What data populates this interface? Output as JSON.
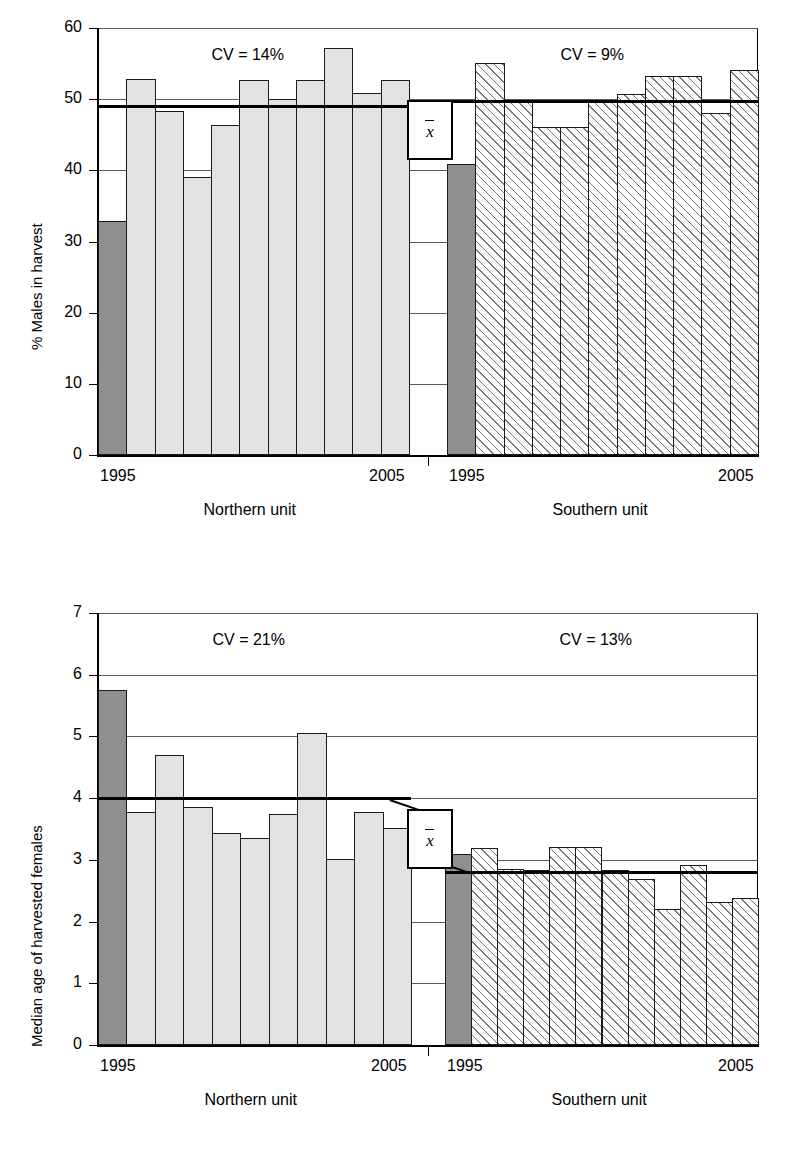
{
  "figure": {
    "panels": [
      {
        "id": "top",
        "ylabel": "% Males in harvest",
        "ylim": [
          0,
          60
        ],
        "yticks": [
          "0",
          "10",
          "20",
          "30",
          "40",
          "50",
          "60"
        ],
        "ytick_values": [
          0,
          10,
          20,
          30,
          40,
          50,
          60
        ],
        "groups": [
          {
            "name": "Northern unit",
            "unit_label": "Northern unit",
            "cv_label": "CV = 14%",
            "x_start_label": "1995",
            "x_end_label": "2005",
            "mean": 49.0,
            "values": [
              32.9,
              52.8,
              48.3,
              39.1,
              46.4,
              52.7,
              50.0,
              52.7,
              57.2,
              50.9,
              52.7
            ]
          },
          {
            "name": "Southern unit",
            "unit_label": "Southern unit",
            "cv_label": "CV = 9%",
            "x_start_label": "1995",
            "x_end_label": "2005",
            "mean": 49.8,
            "values": [
              40.9,
              55.1,
              49.8,
              46.1,
              46.1,
              49.8,
              50.7,
              53.2,
              53.2,
              48.0,
              54.1
            ]
          }
        ]
      },
      {
        "id": "bottom",
        "ylabel": "Median age of harvested females",
        "ylim": [
          0,
          7
        ],
        "yticks": [
          "0",
          "1",
          "2",
          "3",
          "4",
          "5",
          "6",
          "7"
        ],
        "ytick_values": [
          0,
          1,
          2,
          3,
          4,
          5,
          6,
          7
        ],
        "groups": [
          {
            "name": "Northern unit",
            "unit_label": "Northern unit",
            "cv_label": "CV = 21%",
            "x_start_label": "1995",
            "x_end_label": "2005",
            "mean": 4.0,
            "values": [
              5.75,
              3.78,
              4.7,
              3.85,
              3.44,
              3.35,
              3.74,
              5.05,
              3.02,
              3.78,
              3.52
            ]
          },
          {
            "name": "Southern unit",
            "unit_label": "Southern unit",
            "cv_label": "CV = 13%",
            "x_start_label": "1995",
            "x_end_label": "2005",
            "mean": 2.8,
            "values": [
              3.1,
              3.19,
              2.86,
              2.83,
              3.21,
              3.21,
              2.83,
              2.69,
              2.2,
              2.91,
              2.31,
              2.39
            ]
          }
        ]
      }
    ],
    "mean_marker": "x̄",
    "colors": {
      "first_bar": "#8f8f8f",
      "bar_fill": "#e2e2e2",
      "outline": "#1a1a1a",
      "gridline": "#5a5a5a"
    }
  },
  "chart_data": [
    {
      "type": "bar",
      "title": "",
      "xlabel": "",
      "ylabel": "% Males in harvest",
      "ylim": [
        0,
        60
      ],
      "yticks": [
        0,
        10,
        20,
        30,
        40,
        50,
        60
      ],
      "grid": true,
      "legend": "none",
      "panels": [
        {
          "name": "Northern unit",
          "annotation": "CV = 14%",
          "mean_line": 49.0,
          "mean_line_label": "x̄",
          "categories": [
            "1995",
            "1996",
            "1997",
            "1998",
            "1999",
            "2000",
            "2001",
            "2002",
            "2003",
            "2004",
            "2005"
          ],
          "tick_labels_shown": [
            "1995",
            "2005"
          ],
          "values": [
            32.9,
            52.8,
            48.3,
            39.1,
            46.4,
            52.7,
            50.0,
            52.7,
            57.2,
            50.9,
            52.7
          ],
          "highlighted_first_bar": true
        },
        {
          "name": "Southern unit",
          "annotation": "CV = 9%",
          "mean_line": 49.8,
          "mean_line_label": "x̄",
          "categories": [
            "1995",
            "1996",
            "1997",
            "1998",
            "1999",
            "2000",
            "2001",
            "2002",
            "2003",
            "2004",
            "2005"
          ],
          "tick_labels_shown": [
            "1995",
            "2005"
          ],
          "values": [
            40.9,
            55.1,
            49.8,
            46.1,
            46.1,
            49.8,
            50.7,
            53.2,
            53.2,
            48.0,
            54.1
          ],
          "highlighted_first_bar": true
        }
      ]
    },
    {
      "type": "bar",
      "title": "",
      "xlabel": "",
      "ylabel": "Median age of harvested females",
      "ylim": [
        0,
        7
      ],
      "yticks": [
        0,
        1,
        2,
        3,
        4,
        5,
        6,
        7
      ],
      "grid": true,
      "legend": "none",
      "panels": [
        {
          "name": "Northern unit",
          "annotation": "CV = 21%",
          "mean_line": 4.0,
          "mean_line_label": "x̄",
          "categories": [
            "1995",
            "1996",
            "1997",
            "1998",
            "1999",
            "2000",
            "2001",
            "2002",
            "2003",
            "2004",
            "2005"
          ],
          "tick_labels_shown": [
            "1995",
            "2005"
          ],
          "values": [
            5.75,
            3.78,
            4.7,
            3.85,
            3.44,
            3.35,
            3.74,
            5.05,
            3.02,
            3.78,
            3.52
          ],
          "highlighted_first_bar": true
        },
        {
          "name": "Southern unit",
          "annotation": "CV = 13%",
          "mean_line": 2.8,
          "mean_line_label": "x̄",
          "categories": [
            "1995",
            "1996",
            "1997",
            "1998",
            "1999",
            "2000",
            "2001",
            "2002",
            "2003",
            "2004",
            "2005",
            "2006"
          ],
          "tick_labels_shown": [
            "1995",
            "2005"
          ],
          "values": [
            3.1,
            3.19,
            2.86,
            2.83,
            3.21,
            3.21,
            2.83,
            2.69,
            2.2,
            2.91,
            2.31,
            2.39
          ],
          "highlighted_first_bar": true
        }
      ]
    }
  ]
}
